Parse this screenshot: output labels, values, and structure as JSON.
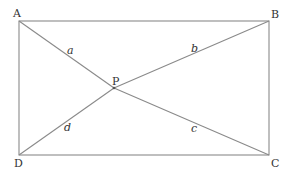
{
  "diagram": {
    "type": "geometry",
    "line_color": "#8a8a8a",
    "text_color": "#333333",
    "vertices": {
      "A": {
        "label": "A",
        "x": 19,
        "y": 21
      },
      "B": {
        "label": "B",
        "x": 269,
        "y": 21
      },
      "C": {
        "label": "C",
        "x": 269,
        "y": 155
      },
      "D": {
        "label": "D",
        "x": 19,
        "y": 155
      },
      "P": {
        "label": "P",
        "x": 114,
        "y": 88
      }
    },
    "segments": {
      "a": {
        "label": "a",
        "from": "A",
        "to": "P"
      },
      "b": {
        "label": "b",
        "from": "P",
        "to": "B"
      },
      "c": {
        "label": "c",
        "from": "P",
        "to": "C"
      },
      "d": {
        "label": "d",
        "from": "D",
        "to": "P"
      }
    }
  }
}
